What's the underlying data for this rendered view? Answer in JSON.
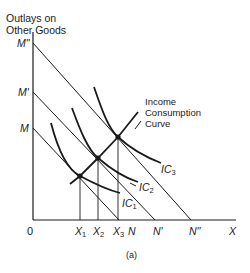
{
  "axes": {
    "y_title_line1": "Outlays on",
    "y_title_line2": "Other Goods",
    "x_label": "X",
    "origin": "0"
  },
  "y_ticks": [
    {
      "label": "M\"",
      "id": "M2"
    },
    {
      "label": "M'",
      "id": "M1"
    },
    {
      "label": "M",
      "id": "M0"
    }
  ],
  "x_ticks": {
    "X1": {
      "main": "X",
      "sub": "1"
    },
    "X2": {
      "main": "X",
      "sub": "2"
    },
    "X3": {
      "main": "X",
      "sub": "3"
    },
    "N": "N",
    "N1": "N'",
    "N2": "N''"
  },
  "curves": {
    "ic1": {
      "main": "IC",
      "sub": "1"
    },
    "ic2": {
      "main": "IC",
      "sub": "2"
    },
    "ic3": {
      "main": "IC",
      "sub": "3"
    }
  },
  "icc_label": {
    "line1": "Income",
    "line2": "Consumption",
    "line3": "Curve"
  },
  "caption": "(a)",
  "colors": {
    "ink": "#1a1a1a",
    "background": "#ffffff"
  }
}
